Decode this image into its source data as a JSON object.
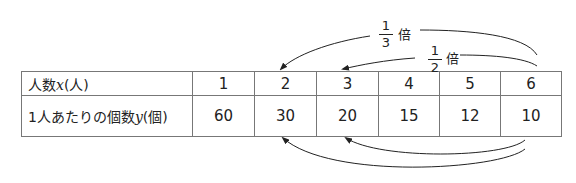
{
  "table": {
    "row1": {
      "label_prefix": "人数",
      "label_var": "x",
      "label_unit": "(人)",
      "values": [
        "1",
        "2",
        "3",
        "4",
        "5",
        "6"
      ]
    },
    "row2": {
      "label_prefix": "1人あたりの個数",
      "label_var": "y",
      "label_unit": "(個)",
      "values": [
        "60",
        "30",
        "20",
        "15",
        "12",
        "10"
      ]
    }
  },
  "annotations": {
    "top_arrow_outer": {
      "from": "6",
      "to": "2",
      "num": "1",
      "den": "3",
      "suffix": "倍"
    },
    "top_arrow_inner": {
      "from": "6",
      "to": "3",
      "num": "1",
      "den": "2",
      "suffix": "倍"
    },
    "bottom_arrow_outer": {
      "from": "10",
      "to": "30"
    },
    "bottom_arrow_inner": {
      "from": "10",
      "to": "20"
    }
  },
  "colors": {
    "line": "#777777",
    "text": "#222222",
    "arrow": "#222222"
  }
}
